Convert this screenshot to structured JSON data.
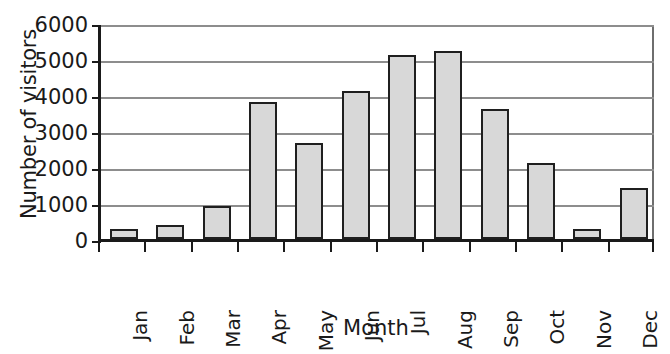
{
  "chart_data": {
    "type": "bar",
    "title": "",
    "xlabel": "Month",
    "ylabel": "Number of visitors",
    "categories": [
      "Jan",
      "Feb",
      "Mar",
      "Apr",
      "May",
      "Jun",
      "Jul",
      "Aug",
      "Sep",
      "Oct",
      "Nov",
      "Dec"
    ],
    "values": [
      280,
      380,
      930,
      3800,
      2670,
      4100,
      5100,
      5220,
      3600,
      2120,
      280,
      1420
    ],
    "ylim": [
      0,
      6000
    ],
    "ytick_values": [
      0,
      1000,
      2000,
      3000,
      4000,
      5000,
      6000
    ],
    "ytick_labels": [
      "0",
      "1000",
      "2000",
      "3000",
      "4000",
      "5000",
      "6000"
    ],
    "grid": true,
    "grid_axis": "y",
    "legend": false,
    "series_name": "Number of visitors",
    "bar_fill_color": "#d8d8d8",
    "bar_edge_color": "#1f1f1f",
    "gridline_color": "#8d8d8d",
    "axis_color": "#1a1a1a",
    "background_color": "#ffffff",
    "xtick_label_rotation": 90
  }
}
